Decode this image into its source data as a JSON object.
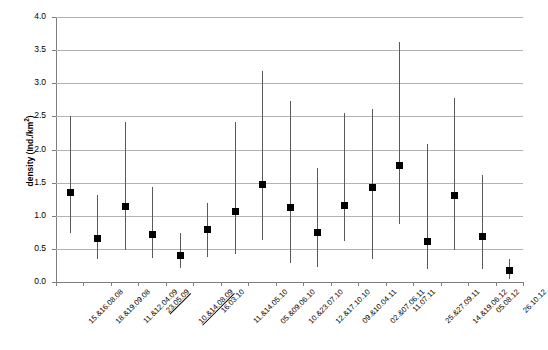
{
  "chart_data": {
    "type": "scatter",
    "title": "",
    "xlabel": "",
    "ylabel": "density (Ind./km²)",
    "ylim": [
      0.0,
      4.0
    ],
    "ytick_values": [
      0.0,
      0.5,
      1.0,
      1.5,
      2.0,
      2.5,
      3.0,
      3.5,
      4.0
    ],
    "ytick_labels": [
      "0.0",
      "0.5",
      "1.0",
      "1.5",
      "2.0",
      "2.5",
      "3.0",
      "3.5",
      "4.0"
    ],
    "grid": true,
    "legend": "none",
    "categories": [
      "15.&16.08.08",
      "18.&19.09.08",
      "11.&12.04.09",
      "23.05.09",
      "10.&14.08.09",
      "16.03.10",
      "11.&14.05.10",
      "05.&09.06.10",
      "10.&23.07.10",
      "12.&17.10.10",
      "09.&10.04.11",
      "02.&07.06.11",
      "11.07.11",
      "25.&27.09.11",
      "14.&19.06.12",
      "05.08.12",
      "26.10.12"
    ],
    "categories_underlined": [
      false,
      false,
      false,
      true,
      true,
      false,
      false,
      false,
      false,
      false,
      false,
      false,
      false,
      false,
      false,
      false,
      false
    ],
    "values": [
      1.35,
      0.66,
      1.14,
      0.71,
      0.4,
      0.79,
      1.07,
      1.47,
      1.13,
      0.75,
      1.16,
      1.43,
      1.76,
      0.61,
      1.31,
      0.69,
      0.17
    ],
    "upper": [
      2.5,
      1.31,
      2.42,
      1.44,
      0.74,
      1.19,
      2.41,
      3.18,
      2.73,
      1.72,
      2.55,
      2.61,
      3.62,
      2.09,
      2.77,
      1.62,
      0.35
    ],
    "lower": [
      0.74,
      0.35,
      0.49,
      0.36,
      0.21,
      0.37,
      0.43,
      0.63,
      0.28,
      0.23,
      0.62,
      0.34,
      0.87,
      0.2,
      0.49,
      0.2,
      0.05
    ],
    "series_name": "density"
  },
  "axis": {
    "y_title_main": "density (Ind./km",
    "y_title_sup": "2",
    "y_title_close": ")"
  }
}
